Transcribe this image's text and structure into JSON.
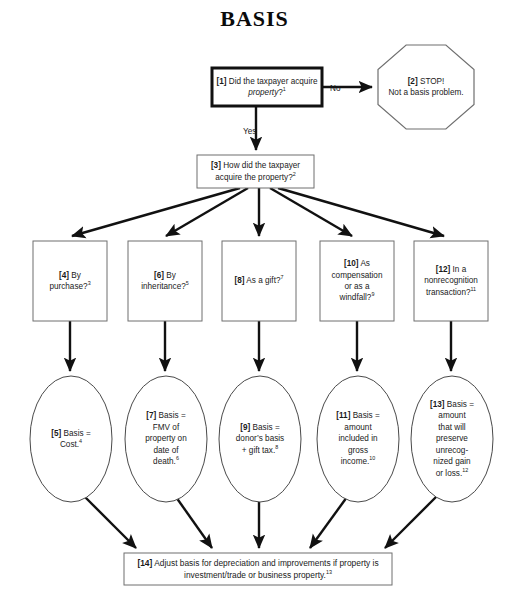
{
  "title": "BASIS",
  "edge_labels": [
    {
      "name": "edge-label-no",
      "text": "No",
      "x": 330,
      "y": 84
    },
    {
      "name": "edge-label-yes",
      "text": "Yes",
      "x": 243,
      "y": 127
    }
  ],
  "nodes": [
    {
      "id": "node-1",
      "name": "decision-box-1-acquire-property",
      "shape": "rect",
      "emphasis": "thick",
      "x": 212,
      "y": 68,
      "w": 110,
      "h": 38,
      "tag": "[1]",
      "text": "Did the taxpayer acquire property?",
      "italic_words": "property",
      "footnote": "1",
      "html": "<b>[1]</b> Did the taxpayer acquire <i>property</i>?<sup>1</sup>"
    },
    {
      "id": "node-2",
      "name": "stop-octagon-2-not-a-basis-problem",
      "shape": "octagon",
      "x": 378,
      "y": 45,
      "w": 96,
      "h": 84,
      "tag": "[2]",
      "text": "STOP! Not a basis problem.",
      "footnote": "",
      "html": "<b>[2]</b> STOP!<br>Not a basis problem."
    },
    {
      "id": "node-3",
      "name": "decision-box-3-how-acquired",
      "shape": "rect",
      "emphasis": "thin",
      "x": 197,
      "y": 155,
      "w": 117,
      "h": 33,
      "tag": "[3]",
      "text": "How did the taxpayer acquire the property?",
      "footnote": "2",
      "html": "<b>[3]</b> How did the taxpayer acquire the property?<sup>2</sup>"
    },
    {
      "id": "node-4",
      "name": "option-box-4-by-purchase",
      "shape": "rect",
      "emphasis": "thin",
      "x": 33,
      "y": 241,
      "w": 74,
      "h": 80,
      "tag": "[4]",
      "text": "By purchase?",
      "footnote": "3",
      "html": "<b>[4]</b> By<br>purchase?<sup>3</sup>"
    },
    {
      "id": "node-6",
      "name": "option-box-6-by-inheritance",
      "shape": "rect",
      "emphasis": "thin",
      "x": 128,
      "y": 241,
      "w": 74,
      "h": 80,
      "tag": "[6]",
      "text": "By inheritance?",
      "footnote": "5",
      "html": "<b>[6]</b> By<br>inheritance?<sup>5</sup>"
    },
    {
      "id": "node-8",
      "name": "option-box-8-as-a-gift",
      "shape": "rect",
      "emphasis": "thin",
      "x": 222,
      "y": 241,
      "w": 74,
      "h": 80,
      "tag": "[8]",
      "text": "As a gift?",
      "footnote": "7",
      "html": "<b>[8]</b> As a gift?<sup>7</sup>"
    },
    {
      "id": "node-10",
      "name": "option-box-10-as-compensation-or-windfall",
      "shape": "rect",
      "emphasis": "thin",
      "x": 320,
      "y": 241,
      "w": 74,
      "h": 80,
      "tag": "[10]",
      "text": "As compensation or as a windfall?",
      "footnote": "9",
      "html": "<b>[10]</b> As<br>compensation<br>or as a<br>windfall?<sup>9</sup>"
    },
    {
      "id": "node-12",
      "name": "option-box-12-nonrecognition-transaction",
      "shape": "rect",
      "emphasis": "thin",
      "x": 414,
      "y": 241,
      "w": 74,
      "h": 80,
      "tag": "[12]",
      "text": "In a nonrecognition transaction?",
      "footnote": "11",
      "html": "<b>[12]</b> In a<br>nonrecognition<br>transaction?<sup>11</sup>"
    },
    {
      "id": "node-5",
      "name": "result-ellipse-5-basis-cost",
      "shape": "ellipse",
      "x": 30,
      "y": 376,
      "w": 82,
      "h": 126,
      "tag": "[5]",
      "text": "Basis = Cost.",
      "footnote": "4",
      "html": "<b>[5]</b> Basis =<br>Cost.<sup>4</sup>"
    },
    {
      "id": "node-7",
      "name": "result-ellipse-7-basis-fmv-date-of-death",
      "shape": "ellipse",
      "x": 125,
      "y": 376,
      "w": 82,
      "h": 126,
      "tag": "[7]",
      "text": "Basis = FMV of property on date of death.",
      "footnote": "6",
      "html": "<b>[7]</b> Basis =<br>FMV of<br>property on<br>date of<br>death.<sup>6</sup>"
    },
    {
      "id": "node-9",
      "name": "result-ellipse-9-basis-donors-basis-plus-gift-tax",
      "shape": "ellipse",
      "x": 219,
      "y": 376,
      "w": 82,
      "h": 126,
      "tag": "[9]",
      "text": "Basis = donor's basis + gift tax.",
      "footnote": "8",
      "html": "<b>[9]</b> Basis =<br>donor&rsquo;s basis<br>+ gift tax.<sup>8</sup>"
    },
    {
      "id": "node-11",
      "name": "result-ellipse-11-basis-amount-in-gross-income",
      "shape": "ellipse",
      "x": 317,
      "y": 376,
      "w": 82,
      "h": 126,
      "tag": "[11]",
      "text": "Basis = amount included in gross income.",
      "footnote": "10",
      "html": "<b>[11]</b> Basis =<br>amount<br>included in<br>gross<br>income.<sup>10</sup>"
    },
    {
      "id": "node-13",
      "name": "result-ellipse-13-basis-preserve-unrecognized-gain-or-loss",
      "shape": "ellipse",
      "x": 411,
      "y": 376,
      "w": 82,
      "h": 126,
      "tag": "[13]",
      "text": "Basis = amount that will preserve unrecognized gain or loss.",
      "footnote": "12",
      "html": "<b>[13]</b> Basis =<br>amount<br>that will<br>preserve<br>unrecog-<br>nized gain<br>or loss.<sup>12</sup>"
    },
    {
      "id": "node-14",
      "name": "outcome-box-14-adjust-basis",
      "shape": "rect",
      "emphasis": "thin",
      "x": 124,
      "y": 553,
      "w": 268,
      "h": 32,
      "tag": "[14]",
      "text": "Adjust basis for depreciation and improvements if property is investment/trade or business property.",
      "footnote": "13",
      "html": "<b>[14]</b> Adjust basis for depreciation and improvements if property is investment/trade or business property.<sup>13</sup>"
    }
  ],
  "edges": [
    {
      "name": "edge-1-to-2",
      "from": "node-1",
      "to": "node-2",
      "path": "M322,87 L372,87",
      "weight": "heavy"
    },
    {
      "name": "edge-1-to-3",
      "from": "node-1",
      "to": "node-3",
      "path": "M256,106 L256,150",
      "weight": "heavy"
    },
    {
      "name": "edge-3-to-4",
      "from": "node-3",
      "to": "node-4",
      "path": "M240,188 L72,236",
      "weight": "heavy"
    },
    {
      "name": "edge-3-to-6",
      "from": "node-3",
      "to": "node-6",
      "path": "M248,188 L166,236",
      "weight": "heavy"
    },
    {
      "name": "edge-3-to-8",
      "from": "node-3",
      "to": "node-8",
      "path": "M259,188 L259,236",
      "weight": "heavy"
    },
    {
      "name": "edge-3-to-10",
      "from": "node-3",
      "to": "node-10",
      "path": "M270,188 L352,236",
      "weight": "heavy"
    },
    {
      "name": "edge-3-to-12",
      "from": "node-3",
      "to": "node-12",
      "path": "M278,188 L444,236",
      "weight": "heavy"
    },
    {
      "name": "edge-4-to-5",
      "from": "node-4",
      "to": "node-5",
      "path": "M70,321 L70,371",
      "weight": "heavy"
    },
    {
      "name": "edge-6-to-7",
      "from": "node-6",
      "to": "node-7",
      "path": "M165,321 L165,371",
      "weight": "heavy"
    },
    {
      "name": "edge-8-to-9",
      "from": "node-8",
      "to": "node-9",
      "path": "M259,321 L259,371",
      "weight": "heavy"
    },
    {
      "name": "edge-10-to-11",
      "from": "node-10",
      "to": "node-11",
      "path": "M357,321 L357,371",
      "weight": "heavy"
    },
    {
      "name": "edge-12-to-13",
      "from": "node-12",
      "to": "node-13",
      "path": "M451,321 L451,371",
      "weight": "heavy"
    },
    {
      "name": "edge-5-to-14",
      "from": "node-5",
      "to": "node-14",
      "path": "M84,496 L136,548",
      "weight": "heavy"
    },
    {
      "name": "edge-7-to-14",
      "from": "node-7",
      "to": "node-14",
      "path": "M176,497 L212,548",
      "weight": "heavy"
    },
    {
      "name": "edge-9-to-14",
      "from": "node-9",
      "to": "node-14",
      "path": "M259,502 L259,548",
      "weight": "heavy"
    },
    {
      "name": "edge-11-to-14",
      "from": "node-11",
      "to": "node-14",
      "path": "M347,497 L310,548",
      "weight": "heavy"
    },
    {
      "name": "edge-13-to-14",
      "from": "node-13",
      "to": "node-14",
      "path": "M437,496 L385,548",
      "weight": "heavy"
    }
  ]
}
